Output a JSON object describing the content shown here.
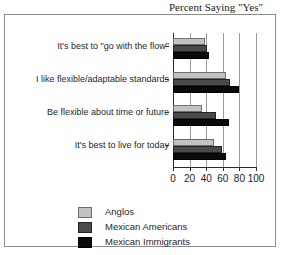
{
  "chart_data": {
    "type": "bar",
    "orientation": "horizontal",
    "title": "Percent Saying \"Yes\"",
    "xlabel": "",
    "ylabel": "",
    "xlim": [
      0,
      100
    ],
    "xticks": [
      0,
      20,
      40,
      60,
      80,
      100
    ],
    "grid": true,
    "legend_position": "bottom",
    "categories": [
      "It's best to \"go with the flow\"",
      "I like flexible/adaptable standards",
      "Be flexible about time or future",
      "It's best to live for today"
    ],
    "series": [
      {
        "name": "Anglos",
        "color": "#c2c2c2",
        "values": [
          38,
          64,
          35,
          49
        ]
      },
      {
        "name": "Mexican Americans",
        "color": "#4a4a4a",
        "values": [
          41,
          69,
          52,
          59
        ]
      },
      {
        "name": "Mexican Immigrants",
        "color": "#0a0a0a",
        "values": [
          43,
          80,
          67,
          64
        ]
      }
    ]
  }
}
